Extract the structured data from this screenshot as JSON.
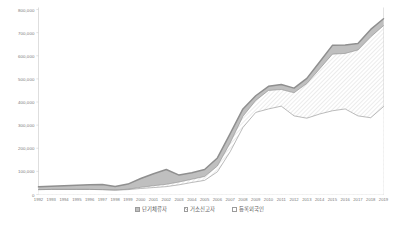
{
  "chart_data": {
    "type": "area",
    "stacked": true,
    "title": "",
    "subtitle": "",
    "xlabel": "",
    "ylabel": "",
    "grid": false,
    "legend_position": "bottom",
    "categories": [
      "1992",
      "1993",
      "1994",
      "1995",
      "1996",
      "1997",
      "1998",
      "1999",
      "2000",
      "2001",
      "2002",
      "2003",
      "2004",
      "2005",
      "2006",
      "2007",
      "2008",
      "2009",
      "2010",
      "2011",
      "2012",
      "2013",
      "2014",
      "2015",
      "2016",
      "2017",
      "2018",
      "2019"
    ],
    "ylim": [
      0,
      800000
    ],
    "yticks": [
      0,
      100000,
      200000,
      300000,
      400000,
      500000,
      600000,
      700000,
      800000
    ],
    "ytick_labels": [
      "0",
      "100,000",
      "200,000",
      "300,000",
      "400,000",
      "500,000",
      "600,000",
      "700,000",
      "800,000"
    ],
    "series": [
      {
        "name": "등록외국인",
        "order": 1,
        "fill": "white",
        "values": [
          21000,
          22000,
          22000,
          22000,
          22000,
          21000,
          19000,
          21000,
          26000,
          30000,
          34000,
          42000,
          52000,
          61000,
          98000,
          185000,
          290000,
          355000,
          370000,
          382000,
          340000,
          330000,
          348000,
          362000,
          370000,
          340000,
          332000,
          380000
        ]
      },
      {
        "name": "거소신고자",
        "order": 2,
        "fill": "hatched",
        "values": [
          0,
          0,
          0,
          0,
          0,
          0,
          0,
          2000,
          5000,
          8000,
          10000,
          12000,
          14000,
          17000,
          25000,
          38000,
          48000,
          52000,
          80000,
          72000,
          100000,
          150000,
          195000,
          245000,
          240000,
          285000,
          350000,
          350000
        ]
      },
      {
        "name": "단기체류자",
        "order": 3,
        "fill": "solid-gray",
        "values": [
          12000,
          14000,
          16000,
          18000,
          20000,
          22000,
          16000,
          22000,
          38000,
          52000,
          64000,
          30000,
          28000,
          30000,
          35000,
          40000,
          32000,
          20000,
          18000,
          22000,
          20000,
          22000,
          30000,
          38000,
          36000,
          28000,
          32000,
          30000
        ]
      }
    ],
    "totals": [
      33000,
      36000,
      38000,
      40000,
      42000,
      43000,
      35000,
      45000,
      69000,
      90000,
      108000,
      84000,
      94000,
      108000,
      158000,
      263000,
      370000,
      427000,
      468000,
      476000,
      460000,
      502000,
      573000,
      645000,
      646000,
      653000,
      714000,
      760000
    ]
  },
  "axis": {
    "y_tick_labels": [
      "800,000",
      "700,000",
      "600,000",
      "500,000",
      "400,000",
      "300,000",
      "200,000",
      "100,000",
      "0"
    ],
    "x_tick_labels": [
      "1992",
      "1993",
      "1994",
      "1995",
      "1996",
      "1997",
      "1998",
      "1999",
      "2000",
      "2001",
      "2002",
      "2003",
      "2004",
      "2005",
      "2006",
      "2007",
      "2008",
      "2009",
      "2010",
      "2011",
      "2012",
      "2013",
      "2014",
      "2015",
      "2016",
      "2017",
      "2018",
      "2019"
    ]
  },
  "legend": {
    "items": [
      {
        "label": "단기체류자",
        "swatch": "solid-gray"
      },
      {
        "label": "거소신고자",
        "swatch": "hatched"
      },
      {
        "label": "등록외국인",
        "swatch": "white"
      }
    ]
  },
  "colors": {
    "area_top": "#bfbfbf",
    "area_mid_hatch": "#c9c9c9",
    "area_bottom": "#ffffff",
    "line": "#8f8f8f",
    "axis": "#d0d0d0",
    "text": "#7a7a7a"
  }
}
